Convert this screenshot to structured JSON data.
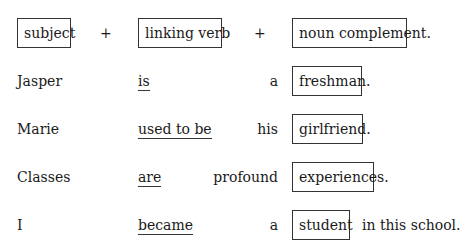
{
  "header": {
    "subject": "subject",
    "plus1": "+",
    "verb": "linking verb",
    "plus2": "+",
    "complement": "noun complement."
  },
  "rows": [
    {
      "subject": "Jasper",
      "verb": "is",
      "modifier": "a",
      "complement": "freshman.",
      "tail": ""
    },
    {
      "subject": "Marie",
      "verb": "used to be",
      "modifier": "his",
      "complement": "girlfriend.",
      "tail": ""
    },
    {
      "subject": "Classes",
      "verb": "are",
      "modifier": "profound",
      "complement": "experiences.",
      "tail": ""
    },
    {
      "subject": "I",
      "verb": "became",
      "modifier": "a",
      "complement": "student",
      "tail": "in this school."
    }
  ]
}
